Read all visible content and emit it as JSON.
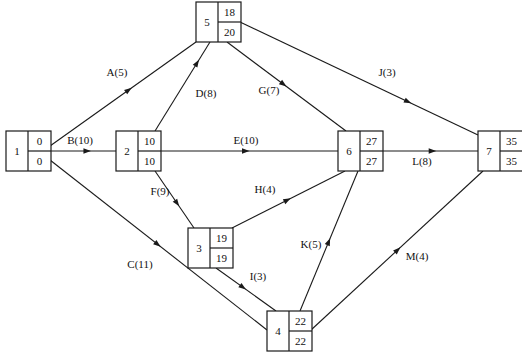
{
  "diagram": {
    "type": "activity-on-arrow-network",
    "title": "",
    "canvas": {
      "width": 522,
      "height": 355
    },
    "nodes": [
      {
        "id": "1",
        "label": "1",
        "early": "0",
        "late": "0",
        "x": 6,
        "y": 131
      },
      {
        "id": "2",
        "label": "2",
        "early": "10",
        "late": "10",
        "x": 116,
        "y": 131
      },
      {
        "id": "3",
        "label": "3",
        "early": "19",
        "late": "19",
        "x": 188,
        "y": 228
      },
      {
        "id": "4",
        "label": "4",
        "early": "22",
        "late": "22",
        "x": 267,
        "y": 311
      },
      {
        "id": "5",
        "label": "5",
        "early": "18",
        "late": "20",
        "x": 196,
        "y": 2
      },
      {
        "id": "6",
        "label": "6",
        "early": "27",
        "late": "27",
        "x": 338,
        "y": 131
      },
      {
        "id": "7",
        "label": "7",
        "early": "35",
        "late": "35",
        "x": 478,
        "y": 131
      }
    ],
    "node_box": {
      "width": 45,
      "height": 40,
      "id_col_width": 22
    },
    "edges": [
      {
        "id": "A",
        "label": "A(5)",
        "activity": "A",
        "duration": 5,
        "from": "1",
        "to": "5",
        "x1": 50,
        "y1": 146,
        "x2": 196,
        "y2": 42,
        "label_x": 117,
        "label_y": 73,
        "arrow_t": 0.56
      },
      {
        "id": "B",
        "label": "B(10)",
        "activity": "B",
        "duration": 10,
        "from": "1",
        "to": "2",
        "x1": 50,
        "y1": 151,
        "x2": 116,
        "y2": 151,
        "label_x": 80,
        "label_y": 141,
        "arrow_t": 0.62
      },
      {
        "id": "C",
        "label": "C(11)",
        "activity": "C",
        "duration": 11,
        "from": "1",
        "to": "4",
        "x1": 50,
        "y1": 160,
        "x2": 267,
        "y2": 330,
        "label_x": 140,
        "label_y": 265,
        "arrow_t": 0.51
      },
      {
        "id": "D",
        "label": "D(8)",
        "activity": "D",
        "duration": 8,
        "from": "2",
        "to": "5",
        "x1": 155,
        "y1": 131,
        "x2": 210,
        "y2": 42,
        "label_x": 206,
        "label_y": 94,
        "arrow_t": 0.8
      },
      {
        "id": "E",
        "label": "E(10)",
        "activity": "E",
        "duration": 10,
        "from": "2",
        "to": "6",
        "x1": 161,
        "y1": 151,
        "x2": 338,
        "y2": 151,
        "label_x": 246,
        "label_y": 141,
        "arrow_t": 0.5
      },
      {
        "id": "F",
        "label": "F(9)",
        "activity": "F",
        "duration": 9,
        "from": "2",
        "to": "3",
        "x1": 155,
        "y1": 171,
        "x2": 194,
        "y2": 228,
        "label_x": 160,
        "label_y": 192,
        "arrow_t": 0.62
      },
      {
        "id": "G",
        "label": "G(7)",
        "activity": "G",
        "duration": 7,
        "from": "5",
        "to": "6",
        "x1": 227,
        "y1": 42,
        "x2": 346,
        "y2": 131,
        "label_x": 269,
        "label_y": 91,
        "arrow_t": 0.5
      },
      {
        "id": "H",
        "label": "H(4)",
        "activity": "H",
        "duration": 4,
        "from": "3",
        "to": "6",
        "x1": 232,
        "y1": 228,
        "x2": 345,
        "y2": 171,
        "label_x": 265,
        "label_y": 190,
        "arrow_t": 0.52
      },
      {
        "id": "I",
        "label": "I(3)",
        "activity": "I",
        "duration": 3,
        "from": "3",
        "to": "4",
        "x1": 216,
        "y1": 268,
        "x2": 276,
        "y2": 311,
        "label_x": 258,
        "label_y": 277,
        "arrow_t": 0.5
      },
      {
        "id": "J",
        "label": "J(3)",
        "activity": "J",
        "duration": 3,
        "from": "5",
        "to": "7",
        "x1": 240,
        "y1": 22,
        "x2": 478,
        "y2": 135,
        "label_x": 387,
        "label_y": 73,
        "arrow_t": 0.72
      },
      {
        "id": "K",
        "label": "K(5)",
        "activity": "K",
        "duration": 5,
        "from": "4",
        "to": "6",
        "x1": 300,
        "y1": 311,
        "x2": 358,
        "y2": 171,
        "label_x": 311,
        "label_y": 245,
        "arrow_t": 0.52
      },
      {
        "id": "L",
        "label": "L(8)",
        "activity": "L",
        "duration": 8,
        "from": "6",
        "to": "7",
        "x1": 383,
        "y1": 151,
        "x2": 478,
        "y2": 151,
        "label_x": 422,
        "label_y": 162,
        "arrow_t": 0.56
      },
      {
        "id": "M",
        "label": "M(4)",
        "activity": "M",
        "duration": 4,
        "from": "4",
        "to": "7",
        "x1": 311,
        "y1": 330,
        "x2": 483,
        "y2": 171,
        "label_x": 417,
        "label_y": 257,
        "arrow_t": 0.52
      }
    ]
  }
}
